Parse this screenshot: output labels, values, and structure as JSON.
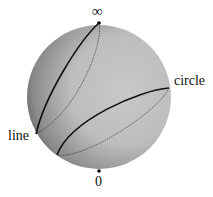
{
  "figure": {
    "labels": {
      "top_point": "∞",
      "bottom_point": "0",
      "circle": "circle",
      "line": "line"
    },
    "colors": {
      "sphere_light": "#c4c4c4",
      "sphere_dark": "#3a3a3a",
      "curve": "#111111"
    }
  }
}
